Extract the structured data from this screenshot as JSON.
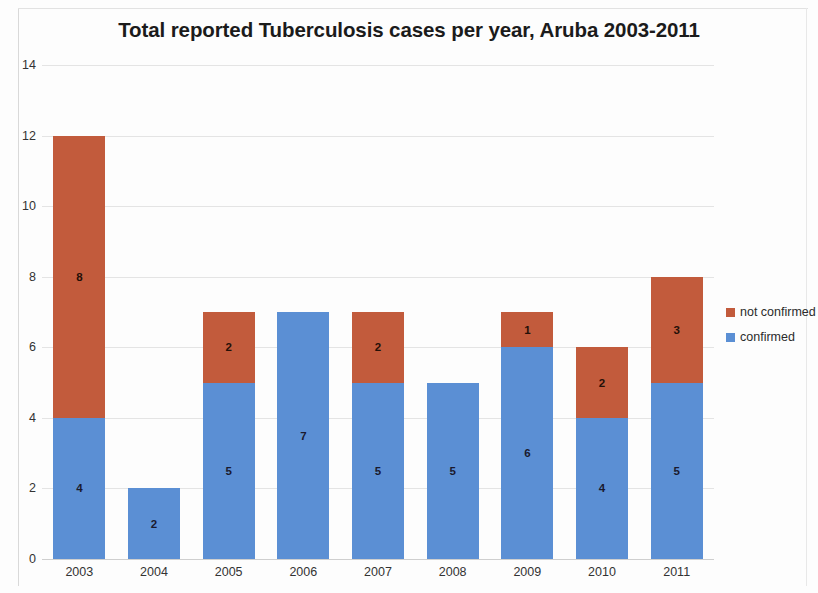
{
  "chart_data": {
    "type": "bar",
    "subtype": "stacked-bar",
    "title": "Total reported Tuberculosis cases per year, Aruba 2003-2011",
    "xlabel": "",
    "ylabel": "",
    "categories": [
      "2003",
      "2004",
      "2005",
      "2006",
      "2007",
      "2008",
      "2009",
      "2010",
      "2011"
    ],
    "series": [
      {
        "name": "confirmed",
        "color": "#5b8fd4",
        "values": [
          4,
          2,
          5,
          7,
          5,
          5,
          6,
          4,
          5
        ]
      },
      {
        "name": "not confirmed",
        "color": "#c25b3c",
        "values": [
          8,
          0,
          2,
          0,
          2,
          0,
          1,
          2,
          3
        ]
      }
    ],
    "totals": [
      12,
      2,
      7,
      7,
      7,
      5,
      7,
      6,
      8
    ],
    "ylim": [
      0,
      14
    ],
    "yticks": [
      "0",
      "2",
      "4",
      "6",
      "8",
      "10",
      "12",
      "14"
    ],
    "ytick_values": [
      0,
      2,
      4,
      6,
      8,
      10,
      12,
      14
    ],
    "grid": true,
    "data_labels": true,
    "legend_position": "right",
    "legend_order": [
      "not confirmed",
      "confirmed"
    ]
  },
  "legend": {
    "items": [
      {
        "label": "not confirmed",
        "color": "#c25b3c"
      },
      {
        "label": "confirmed",
        "color": "#5b8fd4"
      }
    ]
  }
}
